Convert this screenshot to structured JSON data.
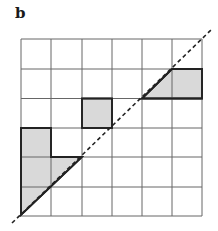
{
  "panel_label": "b",
  "grid": {
    "rows": 6,
    "cols": 6,
    "origin_x": 21,
    "origin_y": 39,
    "cell": 30.2,
    "line_color": "#555555",
    "bold_color": "#222222",
    "fill_color": "#d9d9d9"
  },
  "shaded_regions": [
    {
      "name": "top-right-trapezoid",
      "description": "row 1: half cell under diagonal in col 4 plus full cell col 5"
    },
    {
      "name": "middle-square",
      "description": "row 2, col 2 full cell"
    },
    {
      "name": "bottom-left-staircase",
      "description": "col 0 rows 3-4 full, triangles under diagonal in row 4 col 1 and row 5 col 0"
    }
  ],
  "diagonal": {
    "style": "dashed",
    "solid_segments": 2
  }
}
